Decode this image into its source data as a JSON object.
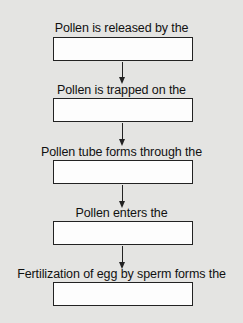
{
  "diagram": {
    "type": "flowchart",
    "direction": "top-to-bottom",
    "steps": [
      {
        "label": "Pollen is released by the",
        "answer": ""
      },
      {
        "label": "Pollen is trapped on the",
        "answer": ""
      },
      {
        "label": "Pollen tube forms through the",
        "answer": ""
      },
      {
        "label": "Pollen enters the",
        "answer": ""
      },
      {
        "label": "Fertilization of egg by sperm forms the",
        "answer": ""
      }
    ],
    "colors": {
      "background": "#e4e4e2",
      "box_fill": "#fdfdfd",
      "stroke": "#222222",
      "text": "#111111"
    }
  }
}
